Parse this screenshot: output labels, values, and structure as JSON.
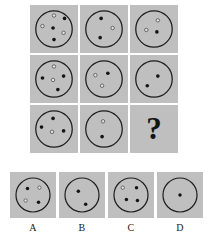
{
  "puzzle": {
    "type": "matrix-reasoning",
    "title": "Dot circle matrix puzzle",
    "missing_cell_label": "?",
    "panel_background": "#bfbfbf",
    "outline_color": "#1c1c1c",
    "filled_dot_color": "#141414",
    "open_dot_color": "#e2e2e2",
    "matrix": {
      "rows": 3,
      "cols": 3,
      "cells": [
        {
          "id": "r1c1",
          "row": 1,
          "col": 1,
          "kind": "circle",
          "filled_count": 3,
          "open_count": 3,
          "total_count": 6,
          "dots": [
            {
              "x": 50,
              "y": 22,
              "type": "open"
            },
            {
              "x": 72,
              "y": 28,
              "type": "filled"
            },
            {
              "x": 26,
              "y": 44,
              "type": "open"
            },
            {
              "x": 48,
              "y": 48,
              "type": "filled"
            },
            {
              "x": 70,
              "y": 58,
              "type": "open"
            },
            {
              "x": 50,
              "y": 72,
              "type": "filled"
            }
          ]
        },
        {
          "id": "r1c2",
          "row": 1,
          "col": 2,
          "kind": "circle",
          "filled_count": 2,
          "open_count": 1,
          "total_count": 3,
          "dots": [
            {
              "x": 44,
              "y": 28,
              "type": "filled"
            },
            {
              "x": 68,
              "y": 48,
              "type": "open"
            },
            {
              "x": 42,
              "y": 68,
              "type": "filled"
            }
          ]
        },
        {
          "id": "r1c3",
          "row": 1,
          "col": 3,
          "kind": "circle",
          "filled_count": 1,
          "open_count": 2,
          "total_count": 3,
          "dots": [
            {
              "x": 58,
              "y": 32,
              "type": "open"
            },
            {
              "x": 34,
              "y": 52,
              "type": "open"
            },
            {
              "x": 56,
              "y": 56,
              "type": "filled"
            }
          ]
        },
        {
          "id": "r2c1",
          "row": 2,
          "col": 1,
          "kind": "circle",
          "filled_count": 3,
          "open_count": 2,
          "total_count": 5,
          "dots": [
            {
              "x": 50,
              "y": 24,
              "type": "open"
            },
            {
              "x": 26,
              "y": 48,
              "type": "filled"
            },
            {
              "x": 70,
              "y": 44,
              "type": "filled"
            },
            {
              "x": 48,
              "y": 52,
              "type": "open"
            },
            {
              "x": 58,
              "y": 72,
              "type": "filled"
            }
          ]
        },
        {
          "id": "r2c2",
          "row": 2,
          "col": 2,
          "kind": "circle",
          "filled_count": 1,
          "open_count": 2,
          "total_count": 3,
          "dots": [
            {
              "x": 32,
              "y": 42,
              "type": "open"
            },
            {
              "x": 58,
              "y": 38,
              "type": "filled"
            },
            {
              "x": 46,
              "y": 64,
              "type": "open"
            }
          ]
        },
        {
          "id": "r2c3",
          "row": 2,
          "col": 3,
          "kind": "circle",
          "filled_count": 2,
          "open_count": 0,
          "total_count": 2,
          "dots": [
            {
              "x": 58,
              "y": 44,
              "type": "filled"
            },
            {
              "x": 36,
              "y": 64,
              "type": "filled"
            }
          ]
        },
        {
          "id": "r3c1",
          "row": 3,
          "col": 1,
          "kind": "circle",
          "filled_count": 3,
          "open_count": 1,
          "total_count": 4,
          "dots": [
            {
              "x": 48,
              "y": 28,
              "type": "filled"
            },
            {
              "x": 24,
              "y": 46,
              "type": "filled"
            },
            {
              "x": 70,
              "y": 54,
              "type": "filled"
            },
            {
              "x": 46,
              "y": 56,
              "type": "open"
            }
          ]
        },
        {
          "id": "r3c2",
          "row": 3,
          "col": 2,
          "kind": "circle",
          "filled_count": 1,
          "open_count": 1,
          "total_count": 2,
          "dots": [
            {
              "x": 48,
              "y": 34,
              "type": "open"
            },
            {
              "x": 46,
              "y": 66,
              "type": "filled"
            }
          ]
        },
        {
          "id": "r3c3",
          "row": 3,
          "col": 3,
          "kind": "question",
          "label": "?"
        }
      ]
    },
    "options": [
      {
        "id": "A",
        "label": "A",
        "filled_count": 2,
        "open_count": 2,
        "total_count": 4,
        "dots": [
          {
            "x": 38,
            "y": 36,
            "type": "filled"
          },
          {
            "x": 64,
            "y": 34,
            "type": "open"
          },
          {
            "x": 34,
            "y": 62,
            "type": "open"
          },
          {
            "x": 62,
            "y": 66,
            "type": "filled"
          }
        ]
      },
      {
        "id": "B",
        "label": "B",
        "filled_count": 2,
        "open_count": 0,
        "total_count": 2,
        "dots": [
          {
            "x": 42,
            "y": 42,
            "type": "filled"
          },
          {
            "x": 58,
            "y": 70,
            "type": "filled"
          }
        ]
      },
      {
        "id": "C",
        "label": "C",
        "filled_count": 3,
        "open_count": 1,
        "total_count": 4,
        "dots": [
          {
            "x": 32,
            "y": 34,
            "type": "open"
          },
          {
            "x": 62,
            "y": 34,
            "type": "filled"
          },
          {
            "x": 40,
            "y": 60,
            "type": "filled"
          },
          {
            "x": 64,
            "y": 62,
            "type": "filled"
          }
        ]
      },
      {
        "id": "D",
        "label": "D",
        "filled_count": 1,
        "open_count": 0,
        "total_count": 1,
        "dots": [
          {
            "x": 50,
            "y": 50,
            "type": "filled"
          }
        ]
      }
    ]
  }
}
